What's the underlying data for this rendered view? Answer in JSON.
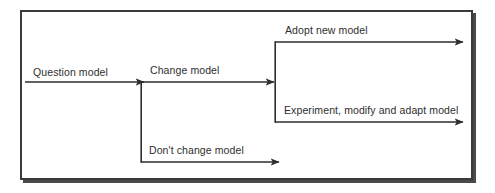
{
  "figure": {
    "type": "flow-diagram",
    "frame": {
      "border_color": "#3a3a3a",
      "shadow_color": "#4a4a4a",
      "background": "#ffffff"
    },
    "line_color": "#2e2e2e",
    "text_color": "#2e2e2e"
  },
  "labels": {
    "question_model": "Question model",
    "change_model": "Change model",
    "adopt_new_model": "Adopt new model",
    "experiment_modify_adapt_model": "Experiment, modify and adapt model",
    "dont_change_model": "Don't change model"
  },
  "flow": {
    "nodes": [
      {
        "id": "question-model",
        "label": "Question model"
      },
      {
        "id": "change-model",
        "label": "Change model"
      },
      {
        "id": "dont-change-model",
        "label": "Don't change model"
      },
      {
        "id": "adopt-new-model",
        "label": "Adopt new model"
      },
      {
        "id": "experiment-modify-adapt-model",
        "label": "Experiment, modify and adapt model"
      }
    ],
    "edges": [
      {
        "from": "question-model",
        "to": "change-model",
        "style": "arrow"
      },
      {
        "from": "change-model",
        "to": "dont-change-model",
        "style": "arrow"
      },
      {
        "from": "change-model",
        "to": "adopt-new-model",
        "style": "arrow"
      },
      {
        "from": "change-model",
        "to": "experiment-modify-adapt-model",
        "style": "arrow"
      }
    ]
  }
}
